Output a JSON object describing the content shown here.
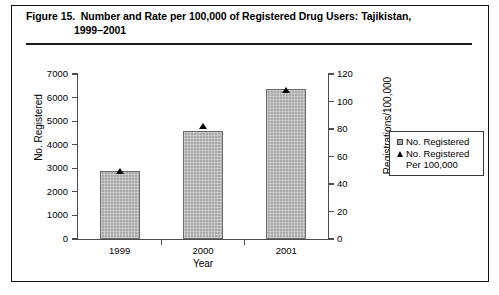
{
  "figure": {
    "title_line_1": "Figure 15.  Number and Rate per 100,000 of Registered Drug Users: Tajikistan,",
    "title_line_2": "1999–2001"
  },
  "chart_data": {
    "type": "bar",
    "title": "Figure 15.  Number and Rate per 100,000 of Registered Drug Users: Tajikistan, 1999–2001",
    "subtitle": "",
    "xlabel": "Year",
    "ylabel": "No. Registered",
    "y2label": "Registrations/100,000",
    "categories": [
      "1999",
      "2000",
      "2001"
    ],
    "ylim": [
      0,
      7000
    ],
    "y2lim": [
      0,
      120
    ],
    "yticks": [
      "0",
      "1000",
      "2000",
      "3000",
      "4000",
      "5000",
      "6000",
      "7000"
    ],
    "ytick_values": [
      0,
      1000,
      2000,
      3000,
      4000,
      5000,
      6000,
      7000
    ],
    "y2ticks": [
      "0",
      "20",
      "40",
      "60",
      "80",
      "100",
      "120"
    ],
    "y2tick_values": [
      0,
      20,
      40,
      60,
      80,
      100,
      120
    ],
    "grid": false,
    "legend_position": "right",
    "series": [
      {
        "name": "No. Registered",
        "marker": "square",
        "type": "bar",
        "axis": "left",
        "color": "#a9a9a9",
        "values": [
          2900,
          4600,
          6350
        ]
      },
      {
        "name": "No. Registered Per 100,000",
        "name_line_1": "No. Registered",
        "name_line_2": "Per 100,000",
        "marker": "triangle",
        "type": "scatter",
        "axis": "right",
        "color": "#000000",
        "values": [
          49,
          82,
          108
        ]
      }
    ]
  },
  "legend": {
    "entries": [
      {
        "label": "No. Registered",
        "label_2": "",
        "marker": "square-marker"
      },
      {
        "label": "No. Registered",
        "label_2": "Per 100,000",
        "marker": "triangle-marker"
      }
    ]
  }
}
